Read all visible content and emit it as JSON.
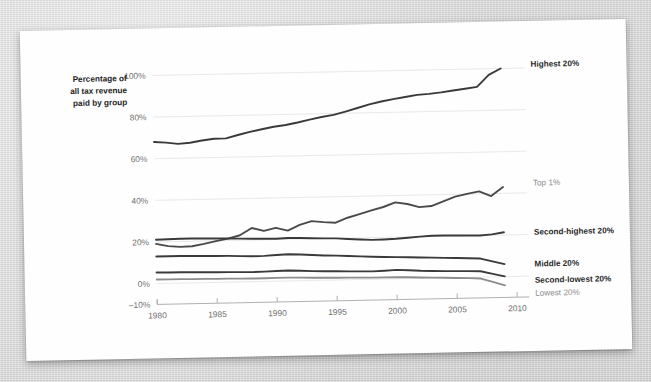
{
  "page": {
    "background_color": "#d4d4d4",
    "paper_color": "#fefefe"
  },
  "chart_data": {
    "type": "line",
    "title": "",
    "subtitle": "",
    "xlabel": "",
    "ylabel": "Percentage of all tax revenue paid by group",
    "ylabel_lines": [
      "Percentage of",
      "all tax revenue",
      "paid by group"
    ],
    "xlim": [
      1980,
      2010
    ],
    "ylim": [
      -10,
      100
    ],
    "grid": true,
    "grid_axis": "y",
    "legend_position": "right-inline",
    "x_ticks": [
      1980,
      1985,
      1990,
      1995,
      2000,
      2005,
      2010
    ],
    "x_tick_labels": [
      "1980",
      "1985",
      "1990",
      "1995",
      "2000",
      "2005",
      "2010"
    ],
    "y_ticks": [
      -10,
      0,
      20,
      40,
      60,
      80,
      100
    ],
    "y_tick_labels": [
      "–10%",
      "0%",
      "20%",
      "40%",
      "60%",
      "80%",
      "100%"
    ],
    "x": [
      1980,
      1981,
      1982,
      1983,
      1984,
      1985,
      1986,
      1987,
      1988,
      1989,
      1990,
      1991,
      1992,
      1993,
      1994,
      1995,
      1996,
      1997,
      1998,
      1999,
      2000,
      2001,
      2002,
      2003,
      2004,
      2005,
      2006,
      2007,
      2008,
      2009
    ],
    "series": [
      {
        "name": "Highest 20%",
        "label": "Highest 20%",
        "color": "#3a3a3a",
        "values": [
          68.0,
          67.6,
          66.9,
          67.3,
          68.3,
          69.0,
          69.1,
          70.6,
          72.0,
          73.1,
          74.2,
          74.9,
          76.0,
          77.3,
          78.4,
          79.3,
          80.8,
          82.4,
          84.0,
          85.3,
          86.3,
          87.2,
          88.1,
          88.5,
          89.1,
          89.9,
          90.6,
          91.4,
          97.0,
          100.0
        ]
      },
      {
        "name": "Top 1%",
        "label": "Top 1%",
        "color": "#4a4a4a",
        "values": [
          19.1,
          17.9,
          17.4,
          17.6,
          18.6,
          19.8,
          20.9,
          22.4,
          25.8,
          24.3,
          25.6,
          24.2,
          26.8,
          28.5,
          27.9,
          27.5,
          29.8,
          31.4,
          33.1,
          34.6,
          36.7,
          35.8,
          34.2,
          34.6,
          36.7,
          38.9,
          40.1,
          41.2,
          38.8,
          43.0
        ]
      },
      {
        "name": "Second-highest 20%",
        "label": "Second-highest 20%",
        "color": "#3a3a3a",
        "values": [
          21.1,
          21.2,
          21.3,
          21.3,
          21.2,
          21.1,
          21.0,
          20.8,
          20.6,
          20.5,
          20.4,
          20.6,
          20.5,
          20.3,
          20.1,
          20.0,
          19.6,
          19.2,
          18.9,
          19.0,
          19.2,
          19.6,
          20.0,
          20.3,
          20.3,
          20.2,
          20.1,
          20.0,
          20.4,
          21.3
        ]
      },
      {
        "name": "Middle 20%",
        "label": "Middle 20%",
        "color": "#3a3a3a",
        "values": [
          13.0,
          13.0,
          13.0,
          12.9,
          12.8,
          12.7,
          12.6,
          12.4,
          12.2,
          12.3,
          12.6,
          12.8,
          12.6,
          12.2,
          11.9,
          11.7,
          11.4,
          11.1,
          10.8,
          10.6,
          10.4,
          10.2,
          10.0,
          9.8,
          9.6,
          9.4,
          9.2,
          8.9,
          7.4,
          6.0
        ]
      },
      {
        "name": "Second-lowest 20%",
        "label": "Second-lowest 20%",
        "color": "#3a3a3a",
        "values": [
          5.3,
          5.2,
          5.2,
          5.1,
          5.0,
          4.9,
          4.8,
          4.7,
          4.6,
          4.7,
          4.9,
          5.0,
          4.8,
          4.5,
          4.3,
          4.2,
          4.0,
          3.9,
          3.8,
          4.0,
          4.3,
          4.0,
          3.6,
          3.4,
          3.2,
          3.1,
          3.0,
          2.8,
          1.4,
          0.1
        ]
      },
      {
        "name": "Lowest 20%",
        "label": "Lowest 20%",
        "color": "#8d8d8d",
        "values": [
          2.0,
          1.9,
          1.9,
          1.8,
          1.8,
          1.7,
          1.7,
          1.6,
          1.5,
          1.5,
          1.6,
          1.6,
          1.5,
          1.3,
          1.2,
          1.1,
          1.0,
          0.9,
          0.8,
          0.8,
          0.8,
          0.6,
          0.4,
          0.2,
          0.0,
          -0.2,
          -0.4,
          -0.7,
          -2.4,
          -4.2
        ]
      }
    ]
  }
}
